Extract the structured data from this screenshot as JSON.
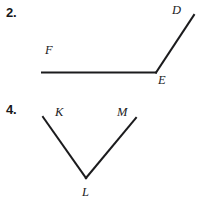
{
  "page": {
    "background_color": "#ffffff",
    "stroke_color": "#1b1b1d",
    "text_color": "#18181a",
    "width": 202,
    "height": 210
  },
  "problems": [
    {
      "number": "2.",
      "figure_type": "angle",
      "vertex": "E",
      "rays": [
        "EF",
        "ED"
      ],
      "labels": [
        {
          "id": "D",
          "text": "D"
        },
        {
          "id": "F",
          "text": "F"
        },
        {
          "id": "E",
          "text": "E"
        }
      ]
    },
    {
      "number": "4.",
      "figure_type": "angle",
      "vertex": "L",
      "rays": [
        "LK",
        "LM"
      ],
      "labels": [
        {
          "id": "K",
          "text": "K"
        },
        {
          "id": "M",
          "text": "M"
        },
        {
          "id": "L",
          "text": "L"
        }
      ]
    }
  ],
  "geometry": {
    "problem2": {
      "segment_FE": {
        "x1": 42,
        "y1": 72.5,
        "x2": 156,
        "y2": 72.5
      },
      "segment_ED": {
        "x1": 156,
        "y1": 72.5,
        "x2": 194,
        "y2": 15
      }
    },
    "problem4": {
      "segment_KL": {
        "x1": 43,
        "y1": 117,
        "x2": 86,
        "y2": 178
      },
      "segment_LM": {
        "x1": 86,
        "y1": 178,
        "x2": 136,
        "y2": 118
      }
    }
  }
}
